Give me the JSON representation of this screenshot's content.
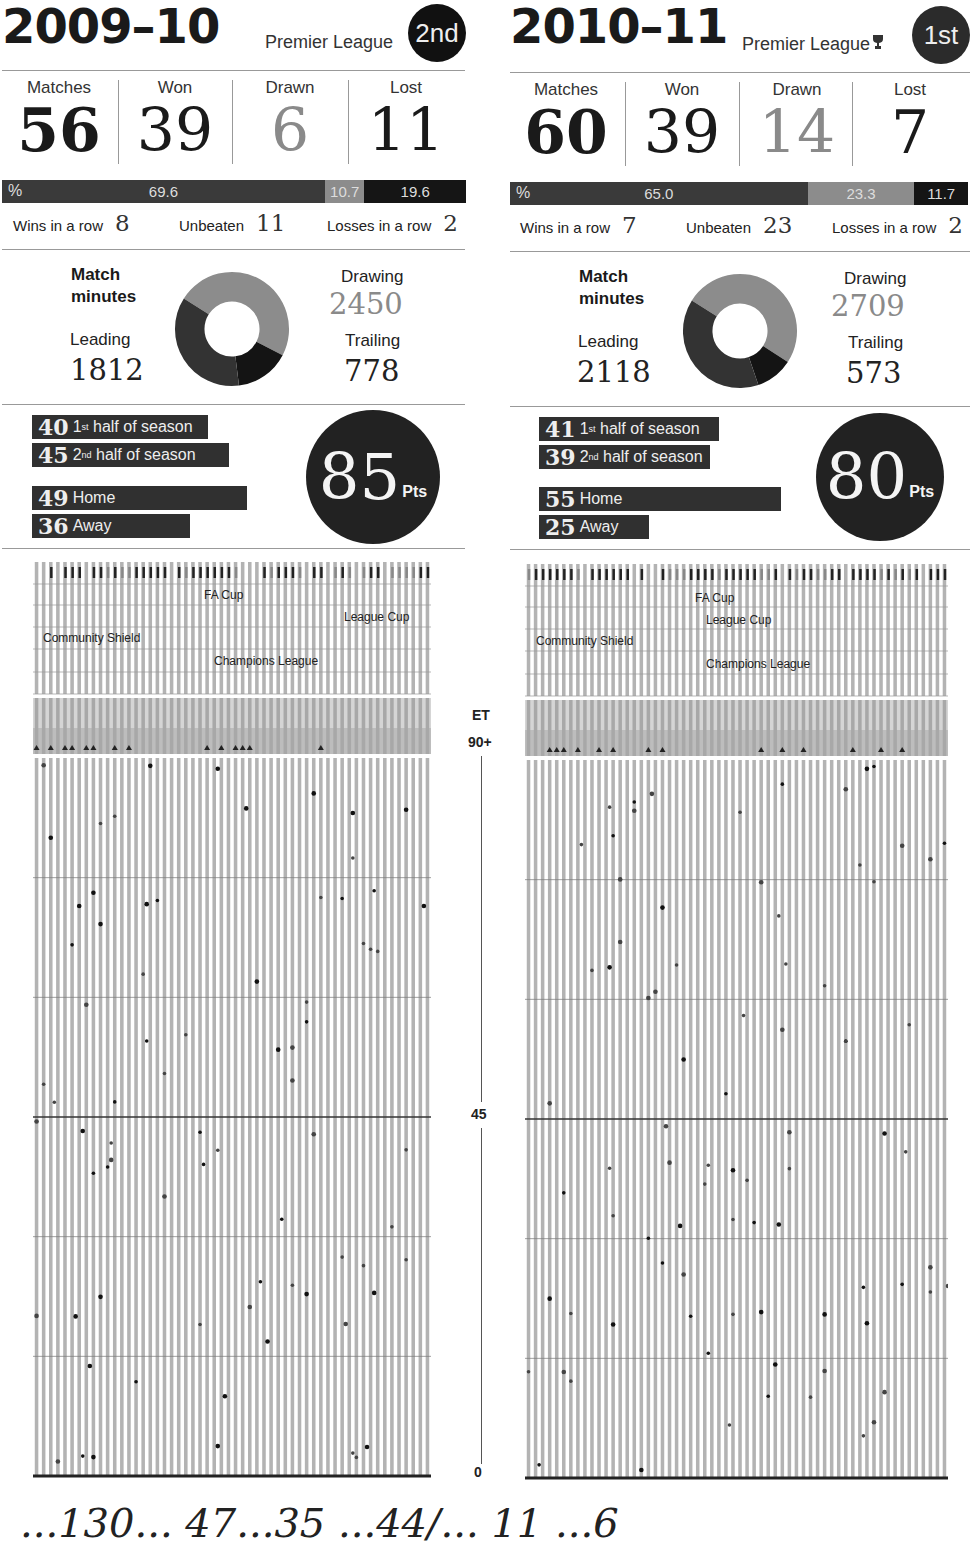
{
  "seasons": [
    {
      "title": "2009–10",
      "competition": "Premier League",
      "trophy_icon": "",
      "position": "2nd",
      "stats": {
        "matches_label": "Matches",
        "matches": "56",
        "won_label": "Won",
        "won": "39",
        "drawn_label": "Drawn",
        "drawn": "6",
        "lost_label": "Lost",
        "lost": "11"
      },
      "pct": {
        "symbol": "%",
        "won": "69.6",
        "drawn": "10.7",
        "lost": "19.6"
      },
      "streaks": {
        "wins_label": "Wins in a row",
        "wins": "8",
        "unbeaten_label": "Unbeaten",
        "unbeaten": "11",
        "losses_label": "Losses in a row",
        "losses": "2"
      },
      "match_minutes": {
        "title_line1": "Match",
        "title_line2": "minutes",
        "leading_label": "Leading",
        "leading": "1812",
        "drawing_label": "Drawing",
        "drawing": "2450",
        "trailing_label": "Trailing",
        "trailing": "778"
      },
      "points": {
        "first_half": "40",
        "first_half_label": "half of season",
        "first_half_ord": "1",
        "first_half_sup": "st",
        "second_half": "45",
        "second_half_label": "half of season",
        "second_half_ord": "2",
        "second_half_sup": "nd",
        "home": "49",
        "home_label": "Home",
        "away": "36",
        "away_label": "Away",
        "total": "85",
        "unit": "Pts"
      },
      "competitions": {
        "fa_cup": "FA Cup",
        "league_cup": "League Cup",
        "community_shield": "Community Shield",
        "champions_league": "Champions League"
      }
    },
    {
      "title": "2010–11",
      "competition": "Premier League",
      "trophy_icon": "🏆",
      "position": "1st",
      "stats": {
        "matches_label": "Matches",
        "matches": "60",
        "won_label": "Won",
        "won": "39",
        "drawn_label": "Drawn",
        "drawn": "14",
        "lost_label": "Lost",
        "lost": "7"
      },
      "pct": {
        "symbol": "%",
        "won": "65.0",
        "drawn": "23.3",
        "lost": "11.7"
      },
      "streaks": {
        "wins_label": "Wins in a row",
        "wins": "7",
        "unbeaten_label": "Unbeaten",
        "unbeaten": "23",
        "losses_label": "Losses in a row",
        "losses": "2"
      },
      "match_minutes": {
        "title_line1": "Match",
        "title_line2": "minutes",
        "leading_label": "Leading",
        "leading": "2118",
        "drawing_label": "Drawing",
        "drawing": "2709",
        "trailing_label": "Trailing",
        "trailing": "573"
      },
      "points": {
        "first_half": "41",
        "first_half_label": "half of season",
        "first_half_ord": "1",
        "first_half_sup": "st",
        "second_half": "39",
        "second_half_label": "half of season",
        "second_half_ord": "2",
        "second_half_sup": "nd",
        "home": "55",
        "home_label": "Home",
        "away": "25",
        "away_label": "Away",
        "total": "80",
        "unit": "Pts"
      },
      "competitions": {
        "fa_cup": "FA Cup",
        "league_cup": "League Cup",
        "community_shield": "Community Shield",
        "champions_league": "Champions League"
      }
    }
  ],
  "axis": {
    "et": "ET",
    "ninety_plus": "90+",
    "forty_five": "45",
    "zero": "0"
  },
  "colors": {
    "won": "#3a3a3a",
    "drawn": "#8c8c8c",
    "lost": "#151515",
    "stripe": "#b3b3b3"
  },
  "bottom_text": "...130...  47...35        ...44/...   11  ...6",
  "chart_data": [
    {
      "type": "pie",
      "title": "Match minutes 2009–10",
      "categories": [
        "Leading",
        "Drawing",
        "Trailing"
      ],
      "values": [
        1812,
        2450,
        778
      ]
    },
    {
      "type": "pie",
      "title": "Match minutes 2010–11",
      "categories": [
        "Leading",
        "Drawing",
        "Trailing"
      ],
      "values": [
        2118,
        2709,
        573
      ]
    },
    {
      "type": "bar",
      "title": "Result percentages",
      "categories": [
        "Won",
        "Drawn",
        "Lost"
      ],
      "series": [
        {
          "name": "2009–10",
          "values": [
            69.6,
            10.7,
            19.6
          ]
        },
        {
          "name": "2010–11",
          "values": [
            65.0,
            23.3,
            11.7
          ]
        }
      ],
      "ylabel": "%"
    },
    {
      "type": "bar",
      "title": "Points breakdown",
      "categories": [
        "1st half of season",
        "2nd half of season",
        "Home",
        "Away",
        "Total"
      ],
      "series": [
        {
          "name": "2009–10",
          "values": [
            40,
            45,
            49,
            36,
            85
          ]
        },
        {
          "name": "2010–11",
          "values": [
            41,
            39,
            55,
            25,
            80
          ]
        }
      ]
    },
    {
      "type": "scatter",
      "title": "Goal minutes per match",
      "ylabel": "Minute",
      "yticks": [
        "0",
        "45",
        "90+",
        "ET"
      ],
      "ylim": [
        0,
        90
      ],
      "series": [
        {
          "name": "2009–10",
          "matches": 56
        },
        {
          "name": "2010–11",
          "matches": 60
        }
      ],
      "legend": [
        "FA Cup",
        "League Cup",
        "Community Shield",
        "Champions League"
      ]
    }
  ]
}
